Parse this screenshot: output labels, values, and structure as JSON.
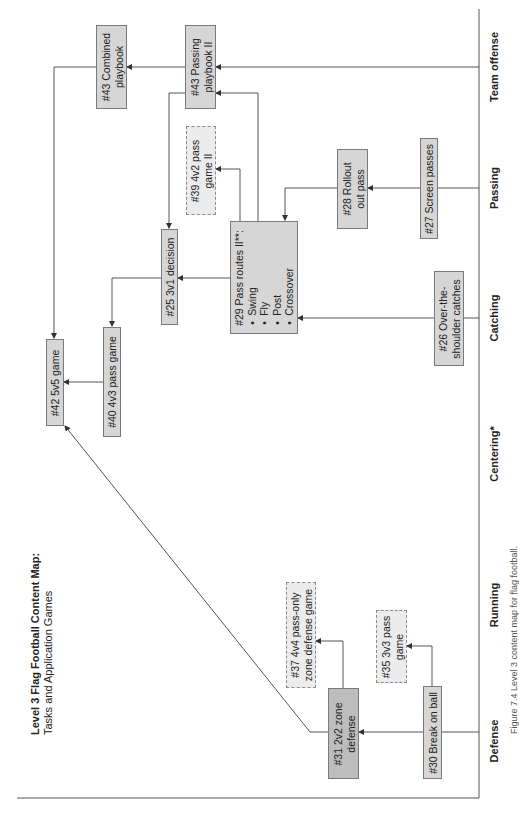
{
  "title": {
    "main": "Level 3 Flag Football Content Map:",
    "subtitle": "Tasks and Application Games"
  },
  "columns": [
    {
      "id": "defense",
      "label": "Defense"
    },
    {
      "id": "running",
      "label": "Running"
    },
    {
      "id": "centering",
      "label": "Centering*"
    },
    {
      "id": "catching",
      "label": "Catching"
    },
    {
      "id": "passing",
      "label": "Passing"
    },
    {
      "id": "team_offense",
      "label": "Team offense"
    }
  ],
  "nodes": {
    "n43_combined": {
      "label": "#43 Combined playbook",
      "style": "task"
    },
    "n43_passing": {
      "label": "#43 Passing playbook II",
      "style": "task"
    },
    "n39": {
      "label": "#39 4v2 pass game II",
      "style": "application-game"
    },
    "n25": {
      "label": "#25 3v1 decision",
      "style": "task"
    },
    "n29": {
      "label": "#29 Pass routes II**:",
      "style": "task",
      "items": [
        "Swing",
        "Fly",
        "Post",
        "Crossover"
      ]
    },
    "n28": {
      "label": "#28 Rollout out pass",
      "style": "task"
    },
    "n27": {
      "label": "#27 Screen passes",
      "style": "task"
    },
    "n26": {
      "label": "#26 Over-the-shoulder catches",
      "style": "task"
    },
    "n42": {
      "label": "#42 5v5 game",
      "style": "task"
    },
    "n40": {
      "label": "#40 4v3 pass game",
      "style": "task"
    },
    "n31": {
      "label": "#31 2v2 zone defense",
      "style": "task-dark"
    },
    "n30": {
      "label": "#30 Break on ball",
      "style": "task"
    },
    "n37": {
      "label": "#37 4v4 pass-only zone defense game",
      "style": "application-game"
    },
    "n35": {
      "label": "#35 3v3 pass game",
      "style": "application-game"
    }
  },
  "edges": [
    {
      "from": "team_offense",
      "to": "n43_passing"
    },
    {
      "from": "n43_passing",
      "to": "n43_combined"
    },
    {
      "from": "n43_combined",
      "to": "n42"
    },
    {
      "from": "n29",
      "to": "n43_passing"
    },
    {
      "from": "n29",
      "to": "n39"
    },
    {
      "from": "n43_passing",
      "to": "n25"
    },
    {
      "from": "n29",
      "to": "n25"
    },
    {
      "from": "n25",
      "to": "n40"
    },
    {
      "from": "n40",
      "to": "n42"
    },
    {
      "from": "passing",
      "to": "n27"
    },
    {
      "from": "n27",
      "to": "n28"
    },
    {
      "from": "n28",
      "to": "n29"
    },
    {
      "from": "catching",
      "to": "n26"
    },
    {
      "from": "n26",
      "to": "n29"
    },
    {
      "from": "defense",
      "to": "n30"
    },
    {
      "from": "n30",
      "to": "n31"
    },
    {
      "from": "n30",
      "to": "n35"
    },
    {
      "from": "n31",
      "to": "n37"
    },
    {
      "from": "n31",
      "to": "n42"
    }
  ],
  "caption": "Figure 7.4 Level 3 content map for flag football."
}
